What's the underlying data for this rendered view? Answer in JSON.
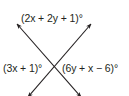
{
  "figure": {
    "type": "intersecting-lines",
    "line_color": "#231f20",
    "labels": {
      "top": "(2x + 2y + 1)°",
      "left": "(3x + 1)°",
      "right": "(6y + x − 6)°"
    }
  }
}
